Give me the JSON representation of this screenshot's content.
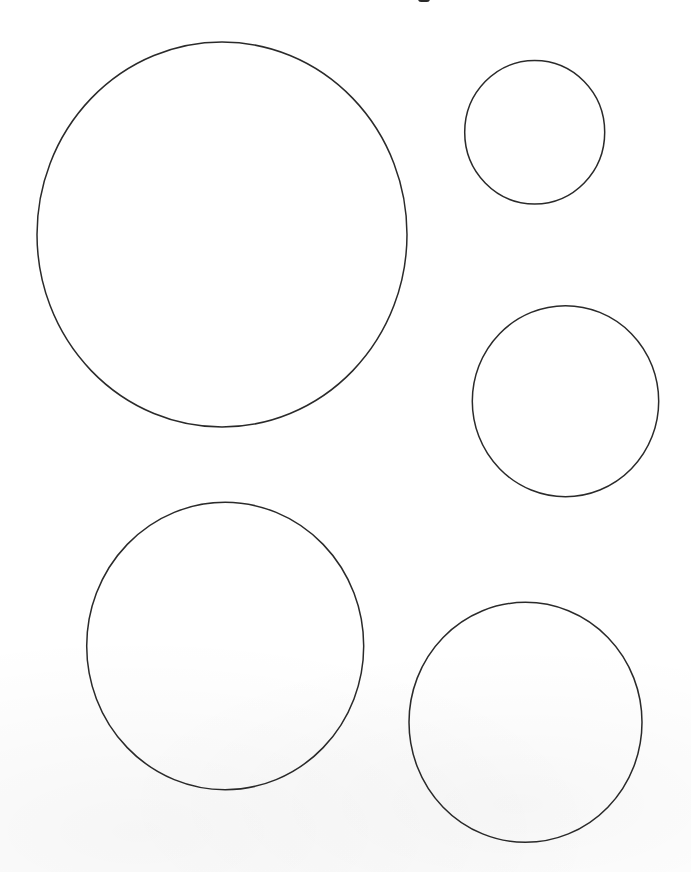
{
  "page": {
    "width": 691,
    "height": 872,
    "background": "#ffffff",
    "stroke_color": "#2a2a2a",
    "stroke_width": 1.5
  },
  "header": {
    "title_fragment_visible": true,
    "title_text": ""
  },
  "shapes": {
    "circles": [
      {
        "id": "circle-large-top-left",
        "cx": 222,
        "cy": 234.5,
        "rx": 185,
        "ry": 192.5,
        "fill": "none"
      },
      {
        "id": "circle-small-top-right",
        "cx": 534.7,
        "cy": 132.3,
        "rx": 70,
        "ry": 71.7,
        "fill": "none"
      },
      {
        "id": "circle-medium-middle-right",
        "cx": 565.5,
        "cy": 401.2,
        "rx": 93.2,
        "ry": 95.5,
        "fill": "none"
      },
      {
        "id": "circle-large-bottom-left",
        "cx": 225.2,
        "cy": 646,
        "rx": 138.5,
        "ry": 143.7,
        "fill": "none"
      },
      {
        "id": "circle-medium-bottom-right",
        "cx": 525.5,
        "cy": 722.3,
        "rx": 116.5,
        "ry": 120,
        "fill": "none"
      }
    ]
  }
}
